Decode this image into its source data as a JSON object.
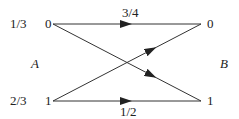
{
  "diagram": {
    "left_set_label": "A",
    "right_set_label": "B",
    "left_nodes": [
      {
        "label": "0",
        "prob": "1/3"
      },
      {
        "label": "1",
        "prob": "2/3"
      }
    ],
    "right_nodes": [
      {
        "label": "0"
      },
      {
        "label": "1"
      }
    ],
    "edges": [
      {
        "from": "A.0",
        "to": "B.0",
        "label": "3/4"
      },
      {
        "from": "A.0",
        "to": "B.1",
        "label": ""
      },
      {
        "from": "A.1",
        "to": "B.0",
        "label": ""
      },
      {
        "from": "A.1",
        "to": "B.1",
        "label": "1/2"
      }
    ],
    "line_color": "#333333"
  }
}
